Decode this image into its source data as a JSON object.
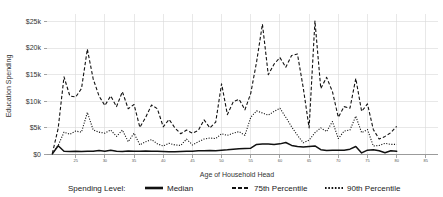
{
  "chart_data": {
    "type": "line",
    "title": "",
    "xlabel": "Age of Household Head",
    "ylabel": "Education Spending",
    "xlim": [
      20,
      87
    ],
    "ylim": [
      0,
      26500
    ],
    "grid": true,
    "y_ticks": [
      0,
      5000,
      10000,
      15000,
      20000,
      25000
    ],
    "y_tick_labels": [
      "$0",
      "$5k",
      "$10k",
      "$15k",
      "$20k",
      "$25k"
    ],
    "x_ticks": [
      25,
      30,
      35,
      40,
      45,
      50,
      55,
      60,
      65,
      70,
      75,
      80,
      85
    ],
    "x_tick_labels": [
      "25",
      "30",
      "35",
      "40",
      "45",
      "50",
      "55",
      "60",
      "65",
      "70",
      "75",
      "80",
      "85"
    ],
    "legend_title": "Spending Level:",
    "legend_position": "bottom",
    "x": [
      21,
      22,
      23,
      24,
      25,
      26,
      27,
      28,
      29,
      30,
      31,
      32,
      33,
      34,
      35,
      36,
      37,
      38,
      39,
      40,
      41,
      42,
      43,
      44,
      45,
      46,
      47,
      48,
      49,
      50,
      51,
      52,
      53,
      54,
      55,
      56,
      57,
      58,
      59,
      60,
      61,
      62,
      63,
      64,
      65,
      66,
      67,
      68,
      69,
      70,
      71,
      72,
      73,
      74,
      75,
      76,
      77,
      78,
      79,
      80
    ],
    "series": [
      {
        "name": "Median",
        "dash": "solid",
        "values": [
          120,
          1650,
          600,
          560,
          600,
          560,
          620,
          600,
          760,
          620,
          820,
          600,
          580,
          640,
          600,
          620,
          640,
          600,
          620,
          560,
          520,
          500,
          560,
          600,
          600,
          700,
          700,
          760,
          720,
          820,
          880,
          1000,
          1080,
          1150,
          1180,
          1900,
          1950,
          1980,
          1900,
          2000,
          2250,
          1700,
          1500,
          1400,
          1500,
          1600,
          900,
          760,
          800,
          820,
          820,
          1000,
          1500,
          300,
          820,
          900,
          700,
          340,
          700,
          600
        ]
      },
      {
        "name": "75th Percentile",
        "dash": "dashed",
        "values": [
          200,
          4900,
          14600,
          11000,
          10800,
          12400,
          19800,
          14200,
          11000,
          9200,
          11000,
          9000,
          11800,
          8600,
          9400,
          5100,
          7000,
          9300,
          8600,
          5200,
          6600,
          5000,
          3900,
          4600,
          4000,
          4500,
          6500,
          5000,
          6100,
          13300,
          7500,
          9900,
          10400,
          8400,
          11500,
          17400,
          24500,
          15000,
          17000,
          18200,
          16400,
          18600,
          18900,
          12500,
          5000,
          25100,
          12400,
          14500,
          11800,
          7000,
          9000,
          8700,
          14300,
          8100,
          9500,
          4700,
          2900,
          3400,
          4100,
          5300
        ]
      },
      {
        "name": "90th Percentile",
        "dash": "dotted",
        "values": [
          200,
          1700,
          4200,
          3800,
          4400,
          4200,
          7900,
          4600,
          4200,
          4000,
          4600,
          3400,
          4600,
          2400,
          4000,
          1800,
          2400,
          2800,
          2000,
          1600,
          2100,
          1800,
          1700,
          2900,
          1800,
          2400,
          2900,
          3100,
          3000,
          3900,
          3600,
          4000,
          4300,
          3600,
          7000,
          8200,
          7800,
          7400,
          8100,
          8700,
          7000,
          5200,
          3600,
          2200,
          2700,
          4100,
          5000,
          4300,
          6200,
          3000,
          4400,
          4600,
          7200,
          4100,
          4700,
          1600,
          1700,
          2100,
          1900,
          1900
        ]
      }
    ]
  },
  "legend": {
    "title": "Spending Level:",
    "items": [
      {
        "label": "Median",
        "style": "solid"
      },
      {
        "label": "75th Percentile",
        "style": "dashed"
      },
      {
        "label": "90th Percentile",
        "style": "dotted"
      }
    ]
  },
  "colors": {
    "line": "#111111",
    "grid": "#d9d9d9",
    "axis": "#7a7a7a",
    "background": "#ffffff"
  }
}
